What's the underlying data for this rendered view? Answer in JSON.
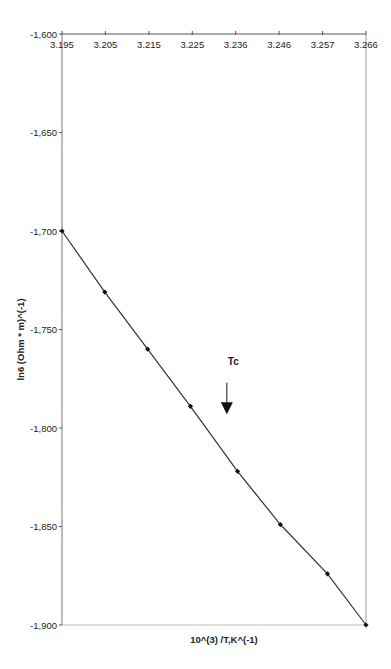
{
  "chart_data": {
    "type": "line",
    "title": "",
    "xlabel": "10^(3) /T,K^(-1)",
    "ylabel": "ln6 (Ohm * m)^(-1)",
    "xlim": [
      3.195,
      3.266
    ],
    "ylim": [
      -1.9,
      -1.6
    ],
    "x_ticks": [
      "3.195",
      "3.205",
      "3.215",
      "3.225",
      "3.236",
      "3.246",
      "3.257",
      "3.266"
    ],
    "y_ticks": [
      "-1,600",
      "-1,650",
      "-1,700",
      "-1,750",
      "-1,800",
      "-1,850",
      "-1,900"
    ],
    "y_tick_values": [
      -1.6,
      -1.65,
      -1.7,
      -1.75,
      -1.8,
      -1.85,
      -1.9
    ],
    "x_axis_position": "top",
    "grid": false,
    "legend": "none",
    "series": [
      {
        "name": "ln sigma",
        "marker": "diamond",
        "color": "#333333",
        "x": [
          3.195,
          3.205,
          3.215,
          3.225,
          3.236,
          3.246,
          3.257,
          3.266
        ],
        "y": [
          -1.7,
          -1.731,
          -1.76,
          -1.789,
          -1.822,
          -1.849,
          -1.874,
          -1.9
        ]
      }
    ],
    "annotations": [
      {
        "text": "Tc",
        "x": 3.235,
        "y": -1.768
      },
      {
        "type": "arrow-down",
        "x": 3.2335,
        "y_from": -1.777,
        "y_to": -1.792
      }
    ]
  }
}
